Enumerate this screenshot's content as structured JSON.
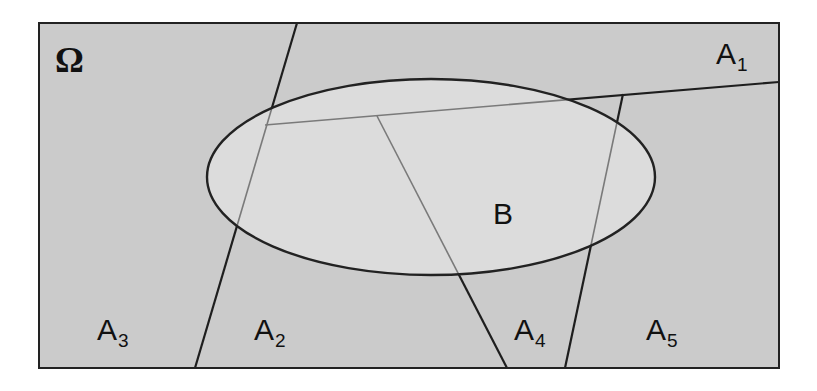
{
  "diagram": {
    "type": "venn-partition",
    "universe": {
      "label": "Ω",
      "fill": "#cbcbcb",
      "stroke": "#222222",
      "rect": {
        "x": 39,
        "y": 23,
        "width": 740,
        "height": 345
      }
    },
    "event_b": {
      "label": "B",
      "fill": "#dcdcdc",
      "stroke": "#222222",
      "ellipse": {
        "cx": 431,
        "cy": 177,
        "rx": 224,
        "ry": 98
      },
      "label_pos": {
        "x": 493,
        "y": 224
      }
    },
    "partitions": [
      {
        "label": "A",
        "sub": "1",
        "pos": {
          "x": 716,
          "y": 64
        }
      },
      {
        "label": "A",
        "sub": "2",
        "pos": {
          "x": 254,
          "y": 340
        }
      },
      {
        "label": "A",
        "sub": "3",
        "pos": {
          "x": 97,
          "y": 340
        }
      },
      {
        "label": "A",
        "sub": "4",
        "pos": {
          "x": 514,
          "y": 340
        }
      },
      {
        "label": "A",
        "sub": "5",
        "pos": {
          "x": 646,
          "y": 340
        }
      }
    ],
    "boundaries": [
      {
        "name": "A1-boundary",
        "from": [
          779,
          82
        ],
        "to": [
          265,
          125
        ]
      },
      {
        "name": "A2-A3-boundary",
        "from": [
          297,
          23
        ],
        "to": [
          195,
          368
        ]
      },
      {
        "name": "A2-A4-boundary",
        "from": [
          377,
          116
        ],
        "to": [
          507,
          368
        ]
      },
      {
        "name": "A4-A5-boundary",
        "from": [
          623,
          94
        ],
        "to": [
          565,
          368
        ]
      }
    ],
    "colors": {
      "line_outside": "#1e1e1e",
      "line_inside": "#7a7a7a",
      "background": "#ffffff"
    }
  }
}
